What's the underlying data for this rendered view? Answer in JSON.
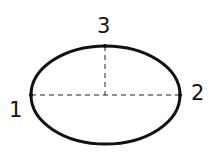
{
  "diagram": {
    "shape": "ellipse",
    "colors": {
      "stroke": "#111111",
      "background": "#ffffff"
    },
    "ellipse": {
      "cx": 105.5,
      "cy": 95,
      "rx": 74.5,
      "ry": 49,
      "stroke_width": 3
    },
    "points": [
      {
        "id": "1",
        "label": "1",
        "x": 31,
        "y": 95
      },
      {
        "id": "2",
        "label": "2",
        "x": 180,
        "y": 95
      },
      {
        "id": "3",
        "label": "3",
        "x": 105,
        "y": 46
      }
    ],
    "dashed_lines": [
      {
        "name": "major-axis",
        "from": "1",
        "to": "2"
      },
      {
        "name": "semi-minor-axis",
        "from": "3",
        "to": "center"
      }
    ]
  }
}
